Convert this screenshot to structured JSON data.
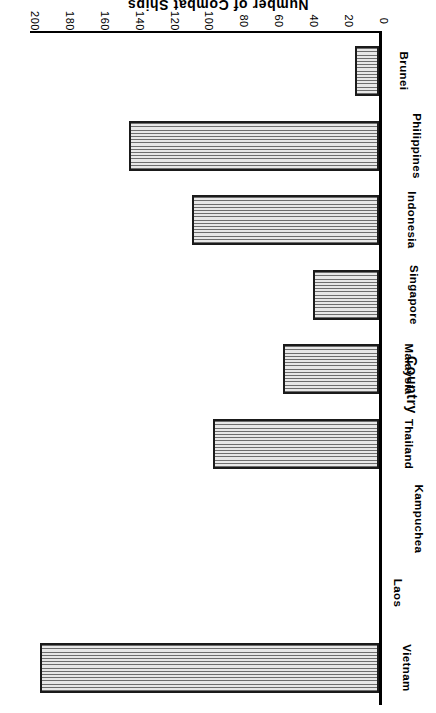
{
  "chart_data": {
    "type": "bar",
    "orientation": "horizontal",
    "title": "",
    "xlabel": "Number of Combat Ships",
    "ylabel": "Country",
    "categories": [
      "Vietnam",
      "Laos",
      "Kampuchea",
      "Thailand",
      "Malaysia",
      "Singapore",
      "Indonesia",
      "Philippines",
      "Brunei"
    ],
    "values": [
      194,
      0,
      0,
      95,
      55,
      38,
      107,
      143,
      14
    ],
    "xlim": [
      0,
      200
    ],
    "xticks": [
      0,
      20,
      40,
      60,
      80,
      100,
      120,
      140,
      160,
      180,
      200
    ],
    "xticklabels": [
      "0",
      "20",
      "40",
      "60",
      "80",
      "100",
      "120",
      "140",
      "160",
      "180",
      "200"
    ],
    "grid": false,
    "legend": false,
    "bar_fill": "#b4b4b4",
    "bar_edge": "#1a1a1a",
    "background": "#ffffff",
    "rotated_180": true
  }
}
